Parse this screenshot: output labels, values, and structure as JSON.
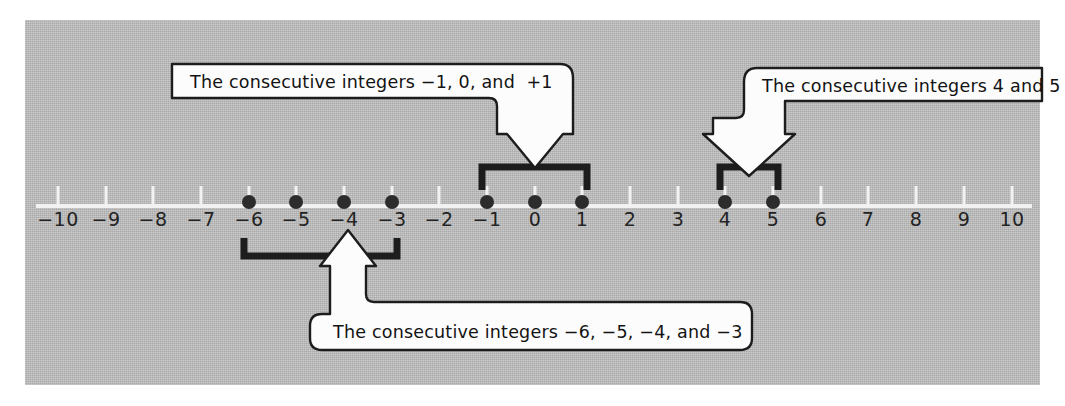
{
  "figure": {
    "panel_color": "#b6b6b6",
    "page_color": "#ffffff",
    "line_color": "#f2f2f2",
    "dot_color": "#2c2c2c",
    "bracket_color": "#1d1d1d",
    "callout_fill": "#fcfcfc",
    "callout_stroke": "#1d1d1d"
  },
  "numberline": {
    "min": -10,
    "max": 10,
    "step": 1,
    "tick_labels": [
      "−10",
      "−9",
      "−8",
      "−7",
      "−6",
      "−5",
      "−4",
      "−3",
      "−2",
      "−1",
      "0",
      "1",
      "2",
      "3",
      "4",
      "5",
      "6",
      "7",
      "8",
      "9",
      "10"
    ],
    "marked_points": [
      -6,
      -5,
      -4,
      -3,
      -1,
      0,
      1,
      4,
      5
    ]
  },
  "callouts": [
    {
      "id": "callout-center",
      "text": "The consecutive integers −1, 0, and  +1",
      "integers": [
        -1,
        0,
        1
      ],
      "bracket_from": -1,
      "bracket_to": 1,
      "arrow_direction": "down"
    },
    {
      "id": "callout-right",
      "text": "The consecutive integers 4 and 5",
      "integers": [
        4,
        5
      ],
      "bracket_from": 4,
      "bracket_to": 5,
      "arrow_direction": "down"
    },
    {
      "id": "callout-bottom",
      "text": "The consecutive integers −6, −5, −4, and −3",
      "integers": [
        -6,
        -5,
        -4,
        -3
      ],
      "bracket_from": -6,
      "bracket_to": -3,
      "arrow_direction": "up"
    }
  ]
}
